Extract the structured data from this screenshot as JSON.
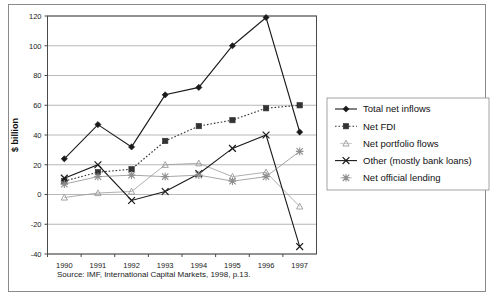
{
  "figure": {
    "source_note": "Source: IMF, International Capital Markets, 1998, p.13."
  },
  "chart_data": {
    "type": "line",
    "title": "",
    "xlabel": "",
    "ylabel": "$ billion",
    "categories": [
      "1990",
      "1991",
      "1992",
      "1993",
      "1994",
      "1995",
      "1996",
      "1997"
    ],
    "x_tick_labels": [
      "1990",
      "1991",
      "1992",
      "1993",
      "1994",
      "1995",
      "1996",
      "1997"
    ],
    "y_tick_labels": [
      "120",
      "100",
      "80",
      "60",
      "40",
      "20",
      "0",
      "-20",
      "-40"
    ],
    "y_ticks": [
      120,
      100,
      80,
      60,
      40,
      20,
      0,
      -20,
      -40
    ],
    "ylim": [
      -40,
      120
    ],
    "grid": true,
    "legend_position": "right",
    "series": [
      {
        "name": "Total net inflows",
        "marker": "diamond",
        "line": "solid",
        "color": "#1a1a1a",
        "values": [
          24,
          47,
          32,
          67,
          72,
          100,
          119,
          42
        ]
      },
      {
        "name": "Net FDI",
        "marker": "square",
        "line": "dotted",
        "color": "#333333",
        "values": [
          9,
          15,
          17,
          36,
          46,
          50,
          58,
          60
        ]
      },
      {
        "name": "Net portfolio flows",
        "marker": "triangle",
        "line": "solid-light",
        "color": "#9a9a9a",
        "values": [
          -2,
          1,
          2,
          20,
          21,
          12,
          15,
          -8
        ]
      },
      {
        "name": "Other (mostly bank loans)",
        "marker": "cross",
        "line": "solid",
        "color": "#1a1a1a",
        "values": [
          11,
          20,
          -4,
          2,
          14,
          31,
          40,
          -35
        ]
      },
      {
        "name": "Net official lending",
        "marker": "asterisk",
        "line": "solid-light",
        "color": "#8f8f8f",
        "values": [
          7,
          12,
          13,
          12,
          13,
          9,
          12,
          29
        ]
      }
    ],
    "legend_entries": [
      "Total net inflows",
      "Net FDI",
      "Net portfolio flows",
      "Other (mostly bank loans)",
      "Net official lending"
    ]
  }
}
